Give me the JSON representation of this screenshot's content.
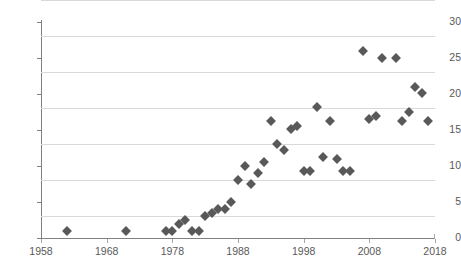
{
  "chart_data": {
    "type": "scatter",
    "title": "",
    "subtitle": "",
    "xlabel": "",
    "ylabel": "",
    "xlim": [
      1958,
      2018
    ],
    "ylim": [
      0,
      30
    ],
    "xticks": [
      1958,
      1968,
      1978,
      1988,
      1998,
      2008,
      2018
    ],
    "xtick_labels": [
      "1958",
      "1968",
      "1978",
      "1988",
      "1998",
      "2008",
      "2018"
    ],
    "yticks": [
      0,
      5,
      10,
      15,
      20,
      25,
      30
    ],
    "ytick_labels": [
      "0",
      "5",
      "10",
      "15",
      "20",
      "25",
      "30"
    ],
    "grid": "horizontal",
    "legend": "none",
    "marker": "diamond",
    "marker_color": "#595959",
    "grid_color": "#d9d9d9",
    "axis_color": "#808080",
    "tick_label_color": "#595959",
    "points": [
      {
        "x": 1962,
        "y": 1
      },
      {
        "x": 1971,
        "y": 1
      },
      {
        "x": 1977,
        "y": 1
      },
      {
        "x": 1978,
        "y": 1
      },
      {
        "x": 1979,
        "y": 2
      },
      {
        "x": 1980,
        "y": 2.5
      },
      {
        "x": 1981,
        "y": 1
      },
      {
        "x": 1982,
        "y": 1
      },
      {
        "x": 1983,
        "y": 3
      },
      {
        "x": 1984,
        "y": 3.5
      },
      {
        "x": 1985,
        "y": 4
      },
      {
        "x": 1986,
        "y": 4
      },
      {
        "x": 1987,
        "y": 5
      },
      {
        "x": 1988,
        "y": 8
      },
      {
        "x": 1989,
        "y": 10
      },
      {
        "x": 1990,
        "y": 7.5
      },
      {
        "x": 1991,
        "y": 9
      },
      {
        "x": 1992,
        "y": 10.5
      },
      {
        "x": 1993,
        "y": 16.2
      },
      {
        "x": 1994,
        "y": 13
      },
      {
        "x": 1995,
        "y": 12.2
      },
      {
        "x": 1996,
        "y": 15.2
      },
      {
        "x": 1997,
        "y": 15.5
      },
      {
        "x": 1998,
        "y": 9.3
      },
      {
        "x": 1999,
        "y": 9.3
      },
      {
        "x": 2000,
        "y": 18.2
      },
      {
        "x": 2001,
        "y": 11.2
      },
      {
        "x": 2002,
        "y": 16.2
      },
      {
        "x": 2003,
        "y": 11
      },
      {
        "x": 2004,
        "y": 9.3
      },
      {
        "x": 2005,
        "y": 9.3
      },
      {
        "x": 2007,
        "y": 26
      },
      {
        "x": 2008,
        "y": 16.5
      },
      {
        "x": 2009,
        "y": 17
      },
      {
        "x": 2010,
        "y": 25
      },
      {
        "x": 2012,
        "y": 25
      },
      {
        "x": 2013,
        "y": 16.3
      },
      {
        "x": 2014,
        "y": 17.5
      },
      {
        "x": 2015,
        "y": 21
      },
      {
        "x": 2016,
        "y": 20.2
      },
      {
        "x": 2017,
        "y": 16.3
      }
    ]
  }
}
